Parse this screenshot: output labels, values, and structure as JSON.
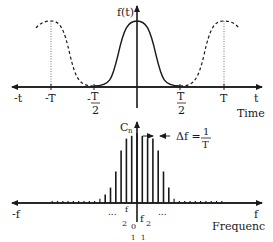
{
  "time_plot": {
    "y_label": "f(t)",
    "x_axis_letter": "t",
    "x_axis_neg": "-t",
    "x_title": "Time",
    "ticks": {
      "neg_T": "-T",
      "neg_half_prefix": "-",
      "half_num": "T",
      "half_den": "2",
      "pos_T": "T"
    }
  },
  "freq_plot": {
    "y_label": "C",
    "y_sub": "n",
    "x_axis_letter": "f",
    "x_axis_neg": "-f",
    "x_title": "Frequenc",
    "delta_f_label": "Δf =",
    "delta_num": "1",
    "delta_den": "T",
    "ellipsis": "...",
    "tick_labels": [
      "f",
      "f",
      "f",
      "f",
      "0",
      "f",
      "f",
      "f"
    ],
    "small_labels": [
      "2",
      "0",
      "2",
      "1",
      "1"
    ],
    "stroke_color": "#1a1a1a"
  },
  "chart_data": {
    "type": "diagram",
    "title": "",
    "panels": [
      {
        "name": "time-domain",
        "ylabel": "f(t)",
        "xlabel": "Time",
        "x_ticks": [
          "-T",
          "-T/2",
          "T/2",
          "T"
        ],
        "series": [
          {
            "name": "single pulse (solid)",
            "shape": "raised-cosine",
            "support": [
              -0.5,
              0.5
            ]
          },
          {
            "name": "periodic repetitions (dashed)",
            "centers": [
              -1,
              1
            ]
          }
        ]
      },
      {
        "name": "frequency-domain",
        "ylabel": "Cn",
        "xlabel": "Frequency",
        "annotation": "Δf = 1/T",
        "spectral_line_relative_heights": [
          0.03,
          0.03,
          0.03,
          0.03,
          0.03,
          0.03,
          0.03,
          0.03,
          0.03,
          0.06,
          0.12,
          0.22,
          0.45,
          0.75,
          0.92,
          0.96,
          1.0,
          0.96,
          0.92,
          0.92,
          0.75,
          0.45,
          0.22,
          0.06,
          0.03,
          0.03,
          0.03,
          0.03,
          0.03,
          0.03,
          0.03,
          0.03,
          0.03
        ]
      }
    ]
  }
}
